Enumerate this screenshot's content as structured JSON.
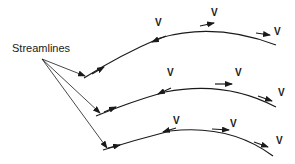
{
  "diagram": {
    "title_label": "Streamlines",
    "velocity_symbol": "V",
    "colors": {
      "line": "#1a1a1a",
      "background": "#ffffff"
    },
    "streamlines": [
      {
        "id": "streamline-1",
        "velocity_labels": [
          "V",
          "V",
          "V"
        ]
      },
      {
        "id": "streamline-2",
        "velocity_labels": [
          "V",
          "V",
          "V"
        ]
      },
      {
        "id": "streamline-3",
        "velocity_labels": [
          "V",
          "V",
          "V"
        ]
      }
    ]
  }
}
